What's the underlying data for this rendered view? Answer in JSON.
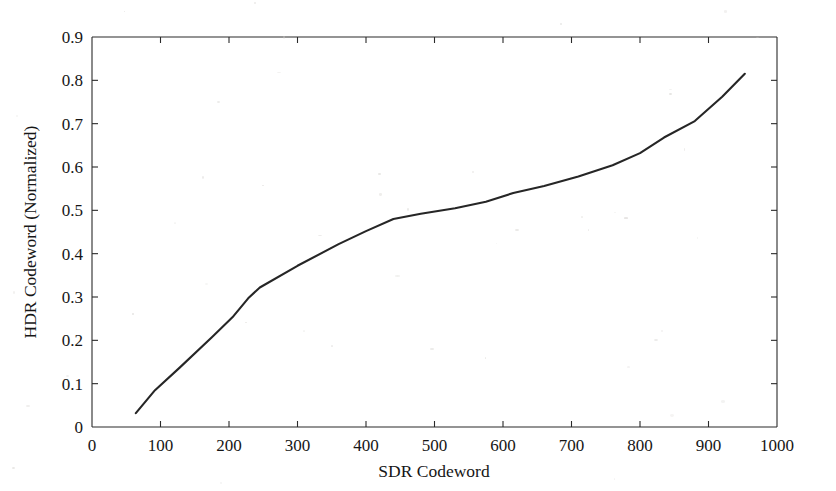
{
  "figure": {
    "background_color": "#ffffff",
    "line_color": "#262626",
    "axis_color": "#2a2a2a"
  },
  "axis_titles": {
    "x": "SDR Codeword",
    "y": "HDR Codeword (Normalized)"
  },
  "chart_data": {
    "type": "line",
    "title": "",
    "xlabel": "SDR Codeword",
    "ylabel": "HDR Codeword (Normalized)",
    "xlim": [
      0,
      1000
    ],
    "ylim": [
      0,
      0.9
    ],
    "grid": false,
    "legend": null,
    "xticks": [
      0,
      100,
      200,
      300,
      400,
      500,
      600,
      700,
      800,
      900,
      1000
    ],
    "xtick_labels": [
      "0",
      "100",
      "200",
      "300",
      "400",
      "500",
      "600",
      "700",
      "800",
      "900",
      "1000"
    ],
    "yticks": [
      0,
      0.1,
      0.2,
      0.3,
      0.4,
      0.5,
      0.6,
      0.7,
      0.8,
      0.9
    ],
    "ytick_labels": [
      "0",
      "0.1",
      "0.2",
      "0.3",
      "0.4",
      "0.5",
      "0.6",
      "0.7",
      "0.8",
      "0.9"
    ],
    "series": [
      {
        "name": "SDR to HDR tone mapping curve",
        "x": [
          64,
          92,
          128,
          175,
          205,
          228,
          245,
          300,
          360,
          400,
          440,
          480,
          530,
          575,
          615,
          660,
          710,
          760,
          800,
          835,
          880,
          920,
          953
        ],
        "y": [
          0.032,
          0.085,
          0.137,
          0.207,
          0.253,
          0.297,
          0.322,
          0.372,
          0.422,
          0.452,
          0.48,
          0.492,
          0.505,
          0.52,
          0.54,
          0.556,
          0.578,
          0.604,
          0.632,
          0.668,
          0.706,
          0.762,
          0.815
        ]
      }
    ]
  }
}
